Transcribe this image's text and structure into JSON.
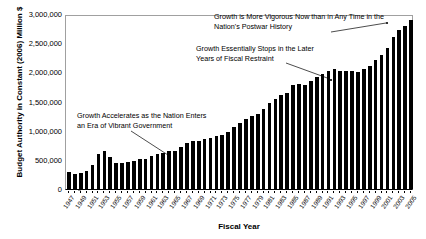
{
  "chart_data": {
    "type": "bar",
    "title": "",
    "xlabel": "Fiscal Year",
    "ylabel": "Budget Authority in Constant (2006) Million $",
    "ylim": [
      0,
      3000000
    ],
    "ytick_values": [
      0,
      500000,
      1000000,
      1500000,
      2000000,
      2500000,
      3000000
    ],
    "ytick_labels": [
      "0",
      "500,000",
      "1,000,000",
      "1,500,000",
      "2,000,000",
      "2,500,000",
      "3,000,000"
    ],
    "grid": false,
    "legend": null,
    "bar_color": "#000000",
    "xtick_labels": [
      "1947",
      "1949",
      "1951",
      "1953",
      "1955",
      "1957",
      "1959",
      "1961",
      "1963",
      "1965",
      "1967",
      "1969",
      "1971",
      "1973",
      "1975",
      "1977",
      "1979",
      "1981",
      "1983",
      "1985",
      "1987",
      "1989",
      "1991",
      "1993",
      "1995",
      "1997",
      "1999",
      "2001",
      "2003",
      "2005"
    ],
    "categories": [
      "1947",
      "1948",
      "1949",
      "1950",
      "1951",
      "1952",
      "1953",
      "1954",
      "1955",
      "1956",
      "1957",
      "1958",
      "1959",
      "1960",
      "1961",
      "1962",
      "1963",
      "1964",
      "1965",
      "1966",
      "1967",
      "1968",
      "1969",
      "1970",
      "1971",
      "1972",
      "1973",
      "1974",
      "1975",
      "1976",
      "1977",
      "1978",
      "1979",
      "1980",
      "1981",
      "1982",
      "1983",
      "1984",
      "1985",
      "1986",
      "1987",
      "1988",
      "1989",
      "1990",
      "1991",
      "1992",
      "1993",
      "1994",
      "1995",
      "1996",
      "1997",
      "1998",
      "1999",
      "2000",
      "2001",
      "2002",
      "2003",
      "2004",
      "2005"
    ],
    "values": [
      290000,
      250000,
      270000,
      310000,
      410000,
      600000,
      650000,
      550000,
      450000,
      440000,
      460000,
      480000,
      520000,
      520000,
      560000,
      600000,
      620000,
      650000,
      660000,
      720000,
      790000,
      830000,
      830000,
      850000,
      870000,
      910000,
      930000,
      980000,
      1060000,
      1130000,
      1200000,
      1250000,
      1290000,
      1380000,
      1480000,
      1540000,
      1620000,
      1650000,
      1780000,
      1800000,
      1790000,
      1850000,
      1920000,
      1980000,
      2020000,
      2050000,
      2030000,
      2020000,
      2030000,
      2010000,
      2060000,
      2110000,
      2210000,
      2300000,
      2420000,
      2600000,
      2720000,
      2800000,
      2900000
    ],
    "annotations": [
      {
        "id": "annotation-0",
        "text": "Growth is More Vigorous Now than in Any Time in the\nNation's Postwar History",
        "points_to_year": "2001"
      },
      {
        "id": "annotation-1",
        "text": "Growth Essentially Stops in the Later\nYears of Fiscal Restraint",
        "points_to_year": "1993"
      },
      {
        "id": "annotation-2",
        "text": "Growth Accelerates as the Nation Enters\nan Era of Vibrant Government",
        "points_to_year": "1962"
      }
    ]
  }
}
